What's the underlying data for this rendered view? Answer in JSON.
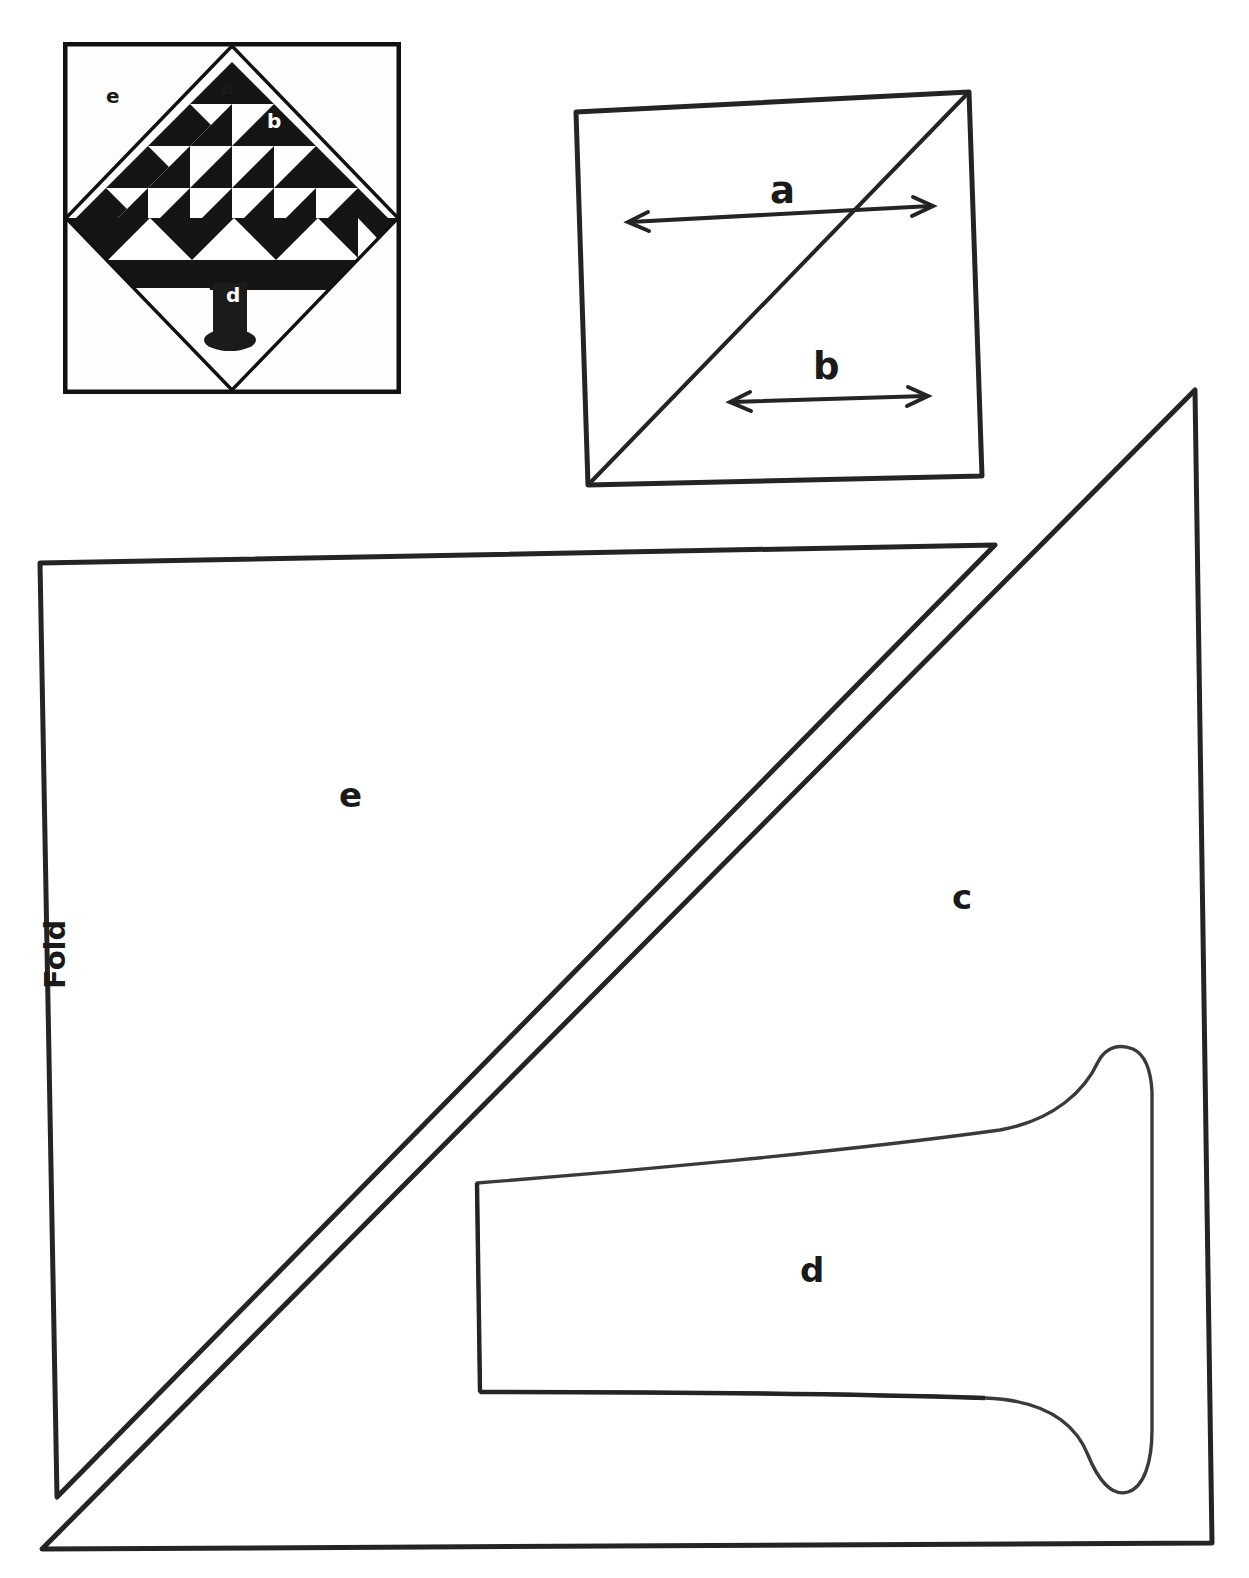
{
  "document": {
    "kind": "quilt-block-pattern-sheet",
    "title": "Pine Tree quilt block pattern pieces"
  },
  "photo": {
    "name": "quilt-block-photograph",
    "description": "Black and white photograph of a pine tree quilt block set on point inside a square",
    "labels": [
      {
        "id": "a",
        "text": "a",
        "x": 228,
        "y": 88,
        "color": "#1a1a1a"
      },
      {
        "id": "b",
        "text": "b",
        "x": 274,
        "y": 122,
        "color": "#ffffff"
      },
      {
        "id": "c",
        "text": "c",
        "x": 228,
        "y": 243,
        "color": "#ffffff"
      },
      {
        "id": "d",
        "text": "d",
        "x": 232,
        "y": 296,
        "color": "#ffffff"
      },
      {
        "id": "e",
        "text": "e",
        "x": 113,
        "y": 97,
        "color": "#1a1a1a"
      }
    ]
  },
  "diagram_ab": {
    "name": "square-with-diagonal",
    "description": "Square with a diagonal from the lower-left to the upper-right corner, showing measurement a across the upper half and measurement b across the lower half",
    "measure_a": {
      "label": "a",
      "label_x": 783,
      "label_y": 176
    },
    "measure_b": {
      "label": "b",
      "label_x": 826,
      "label_y": 352
    }
  },
  "diagram_main": {
    "name": "large-pattern-pieces",
    "fold_label": "Fold",
    "fold_label_x": 88,
    "fold_label_y": 1030,
    "pieces": [
      {
        "id": "e",
        "label": "e",
        "label_x": 349,
        "label_y": 795,
        "shape": "right-triangle-corner-setting-triangle"
      },
      {
        "id": "c",
        "label": "c",
        "label_x": 962,
        "label_y": 897,
        "shape": "large-right-triangle"
      },
      {
        "id": "d",
        "label": "d",
        "label_x": 811,
        "label_y": 1270,
        "shape": "flared-tree-trunk"
      }
    ]
  },
  "colors": {
    "ink": "#1a1a1a",
    "paper": "#ffffff",
    "line": "#242424"
  }
}
